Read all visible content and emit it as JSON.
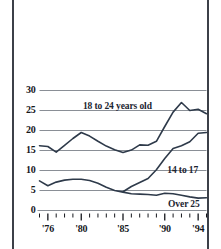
{
  "chart_data": {
    "type": "line",
    "title": "",
    "subtitle": "",
    "xlabel": "",
    "ylabel": "",
    "grid": true,
    "legend_position": "inline-annotations",
    "xlim": [
      1975,
      1995
    ],
    "ylim": [
      0,
      30
    ],
    "yticks": [
      0,
      5,
      10,
      15,
      20,
      25,
      30
    ],
    "ytick_labels": [
      "0",
      "5",
      "10",
      "15",
      "20",
      "25",
      "30"
    ],
    "xticks": [
      1975,
      1976,
      1977,
      1978,
      1979,
      1980,
      1981,
      1982,
      1983,
      1984,
      1985,
      1986,
      1987,
      1988,
      1989,
      1990,
      1991,
      1992,
      1993,
      1994,
      1995
    ],
    "xtick_labels": [
      "'76",
      "'80",
      "'85",
      "'90",
      "'94"
    ],
    "xtick_label_years": [
      1976,
      1980,
      1985,
      1990,
      1994
    ],
    "x": [
      1975,
      1976,
      1977,
      1978,
      1979,
      1980,
      1981,
      1982,
      1983,
      1984,
      1985,
      1986,
      1987,
      1988,
      1989,
      1990,
      1991,
      1992,
      1993,
      1994,
      1995
    ],
    "series": [
      {
        "name": "18 to 24 years old",
        "color": "#2e3a4a",
        "x": [
          1975,
          1976,
          1977,
          1978,
          1979,
          1980,
          1981,
          1982,
          1983,
          1984,
          1985,
          1986,
          1987,
          1988,
          1989,
          1990,
          1991,
          1992,
          1993,
          1994,
          1995
        ],
        "values": [
          16.2,
          16.0,
          14.6,
          16.3,
          18.0,
          19.5,
          18.6,
          17.3,
          16.1,
          15.2,
          14.5,
          15.1,
          16.4,
          16.3,
          17.3,
          21.0,
          24.6,
          27.0,
          25.0,
          25.3,
          24.2
        ],
        "label_text": "18 to 24 years old",
        "label_x": 1980.2,
        "label_y": 26.2
      },
      {
        "name": "14 to 17",
        "color": "#2e3a4a",
        "x": [
          1985,
          1986,
          1987,
          1988,
          1989,
          1990,
          1991,
          1992,
          1993,
          1994,
          1995
        ],
        "values": [
          4.7,
          6.0,
          7.0,
          8.0,
          10.2,
          13.0,
          15.5,
          16.2,
          17.2,
          19.3,
          19.5
        ],
        "label_text": "14 to 17",
        "label_x": 1990.3,
        "label_y": 10.2
      },
      {
        "name": "Over 25",
        "color": "#2e3a4a",
        "x": [
          1975,
          1976,
          1977,
          1978,
          1979,
          1980,
          1981,
          1982,
          1983,
          1984,
          1985,
          1986,
          1987,
          1988,
          1989,
          1990,
          1991,
          1992,
          1993,
          1994,
          1995
        ],
        "values": [
          7.4,
          6.2,
          7.1,
          7.6,
          7.8,
          7.8,
          7.5,
          6.8,
          5.8,
          5.0,
          4.6,
          4.2,
          4.1,
          4.0,
          3.8,
          4.3,
          4.2,
          3.8,
          3.4,
          3.1,
          3.2
        ],
        "label_text": "Over 25",
        "label_x": 1990.4,
        "label_y": 1.6
      }
    ],
    "colors": {
      "line": "#2e3a4a",
      "gridline": "#8a8f96",
      "axis": "#15171c",
      "border": "#3c4048",
      "background": "#ffffff"
    }
  }
}
